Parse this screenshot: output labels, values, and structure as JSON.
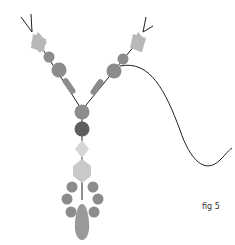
{
  "figure": {
    "label": "fig 5"
  },
  "colors": {
    "cord": "#1f1f1f",
    "bead_light": "#b8b8b8",
    "bead_mid": "#8c8c8c",
    "bead_dark": "#5e5e5e",
    "bead_pale": "#d6d6d6"
  },
  "beads": {
    "left_strand": [
      "diamond",
      "round-small",
      "round-large",
      "tube"
    ],
    "right_strand": [
      "diamond",
      "round-small",
      "round-large",
      "tube"
    ],
    "center_stem": [
      "round-mid",
      "round-dark",
      "diamond-pale",
      "faceted-pale"
    ],
    "loop": [
      "round",
      "round",
      "round",
      "round",
      "round",
      "round"
    ],
    "pendant": "teardrop"
  }
}
